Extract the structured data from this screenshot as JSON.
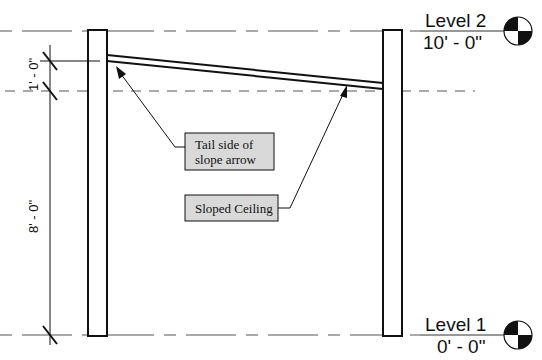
{
  "levels": [
    {
      "name": "Level 2",
      "elevation": "10' - 0\""
    },
    {
      "name": "Level 1",
      "elevation": "0' - 0\""
    }
  ],
  "dimensions": {
    "upper": "1' - 0\"",
    "lower": "8' - 0\""
  },
  "annotations": {
    "tail_label_line1": "Tail side of",
    "tail_label_line2": "slope arrow",
    "ceiling_label": "Sloped Ceiling"
  },
  "colors": {
    "line": "#111111",
    "dashed": "#555555",
    "tag_fill": "#d9d9d9"
  }
}
